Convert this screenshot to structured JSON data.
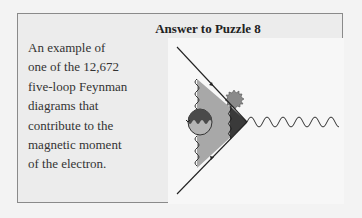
{
  "title": "Answer to Puzzle 8",
  "caption": {
    "lines": [
      "An example of",
      "one of the 12,672",
      "five-loop Feynman",
      "diagrams that",
      "contribute to the",
      "magnetic moment",
      "of the electron."
    ]
  },
  "diagram": {
    "colors": {
      "line": "#222222",
      "light_gray": "#a8a8a8",
      "mid_gray": "#8a8a8a",
      "dark": "#3a3a3a"
    }
  }
}
